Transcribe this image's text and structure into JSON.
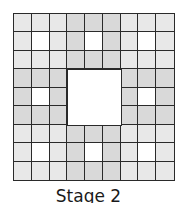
{
  "figure": {
    "caption": "Stage 2",
    "grid_size": 9,
    "colors": {
      "corner_block": "#e8e8e8",
      "edge_block": "#d9d9d9",
      "hole": "#ffffff",
      "line": "#2a2a2a"
    },
    "removed_center": {
      "row": 3,
      "col": 3,
      "size": 3
    },
    "removed_small": [
      [
        1,
        1
      ],
      [
        1,
        4
      ],
      [
        1,
        7
      ],
      [
        4,
        1
      ],
      [
        4,
        7
      ],
      [
        7,
        1
      ],
      [
        7,
        4
      ],
      [
        7,
        7
      ]
    ]
  }
}
